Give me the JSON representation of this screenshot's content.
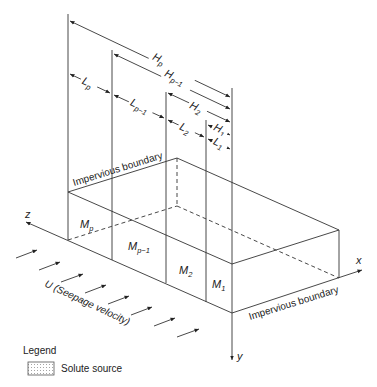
{
  "diagram": {
    "dimension_labels": {
      "Hp": {
        "main": "H",
        "sub": "p"
      },
      "Hp1": {
        "main": "H",
        "sub": "p−1"
      },
      "H2": {
        "main": "H",
        "sub": "2"
      },
      "H1": {
        "main": "H",
        "sub": "1"
      },
      "Lp": {
        "main": "L",
        "sub": "p"
      },
      "Lp1": {
        "main": "L",
        "sub": "p−1"
      },
      "L2": {
        "main": "L",
        "sub": "2"
      },
      "L1": {
        "main": "L",
        "sub": "1"
      }
    },
    "zone_labels": {
      "Mp": {
        "main": "M",
        "sub": "p"
      },
      "Mp1": {
        "main": "M",
        "sub": "p−1"
      },
      "M2": {
        "main": "M",
        "sub": "2"
      },
      "M1": {
        "main": "M",
        "sub": "1"
      }
    },
    "boundary_top": "Impervious boundary",
    "boundary_bottom": "Impervious boundary",
    "axes": {
      "x": "x",
      "y": "y",
      "z": "z"
    },
    "flow_label": "U (Seepage velocity)",
    "legend": {
      "title": "Legend",
      "items": [
        {
          "label": "Solute source",
          "pattern": "dotted-grid"
        }
      ]
    },
    "colors": {
      "line": "#333333",
      "text": "#222222"
    }
  }
}
